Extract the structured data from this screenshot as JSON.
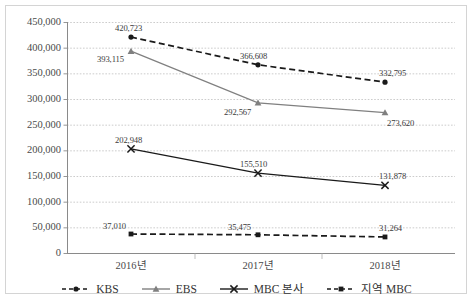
{
  "chart_data": {
    "type": "line",
    "title": "",
    "xlabel": "",
    "ylabel": "",
    "categories": [
      "2016년",
      "2017년",
      "2018년"
    ],
    "ylim": [
      0,
      450000
    ],
    "ytick_step": 50000,
    "yticks": [
      "0",
      "50,000",
      "100,000",
      "150,000",
      "200,000",
      "250,000",
      "300,000",
      "350,000",
      "400,000",
      "450,000"
    ],
    "grid": true,
    "legend_position": "bottom",
    "series": [
      {
        "name": "KBS",
        "values": [
          420723,
          366608,
          332795
        ],
        "labels": [
          "420,723",
          "366,608",
          "332,795"
        ],
        "line_style": "dashed",
        "marker": "circle",
        "color": "#1a1a1a"
      },
      {
        "name": "EBS",
        "values": [
          393115,
          292567,
          273620
        ],
        "labels": [
          "393,115",
          "292,567",
          "273,620"
        ],
        "line_style": "solid",
        "marker": "triangle",
        "color": "#808080"
      },
      {
        "name": "MBC 본사",
        "values": [
          202948,
          155510,
          131878
        ],
        "labels": [
          "202,948",
          "155,510",
          "131,878"
        ],
        "line_style": "solid",
        "marker": "x",
        "color": "#1a1a1a"
      },
      {
        "name": "지역 MBC",
        "values": [
          37010,
          35475,
          31264
        ],
        "labels": [
          "37,010",
          "35,475",
          "31,264"
        ],
        "line_style": "dashed",
        "marker": "square",
        "color": "#1a1a1a"
      }
    ]
  },
  "legend": {
    "items": [
      {
        "label": "KBS"
      },
      {
        "label": "EBS"
      },
      {
        "label": "MBC 본사"
      },
      {
        "label": "지역 MBC"
      }
    ]
  },
  "axes": {
    "y_labels": [
      "450,000",
      "400,000",
      "350,000",
      "300,000",
      "250,000",
      "200,000",
      "150,000",
      "100,000",
      "50,000",
      "0"
    ],
    "x_labels": [
      "2016년",
      "2017년",
      "2018년"
    ]
  }
}
